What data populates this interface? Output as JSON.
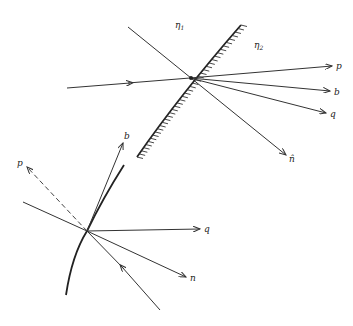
{
  "top_diagram": {
    "medium_labels": {
      "eta1": "η",
      "eta1_sub": "1",
      "eta2": "η",
      "eta2_sub": "2"
    },
    "vectors": {
      "p": "p",
      "b": "b",
      "q": "q",
      "n_hat": "n̂"
    }
  },
  "bottom_diagram": {
    "vectors": {
      "p": "p",
      "b": "b",
      "q": "q",
      "n": "n"
    }
  },
  "colors": {
    "line": "#333333",
    "background": "#ffffff"
  }
}
